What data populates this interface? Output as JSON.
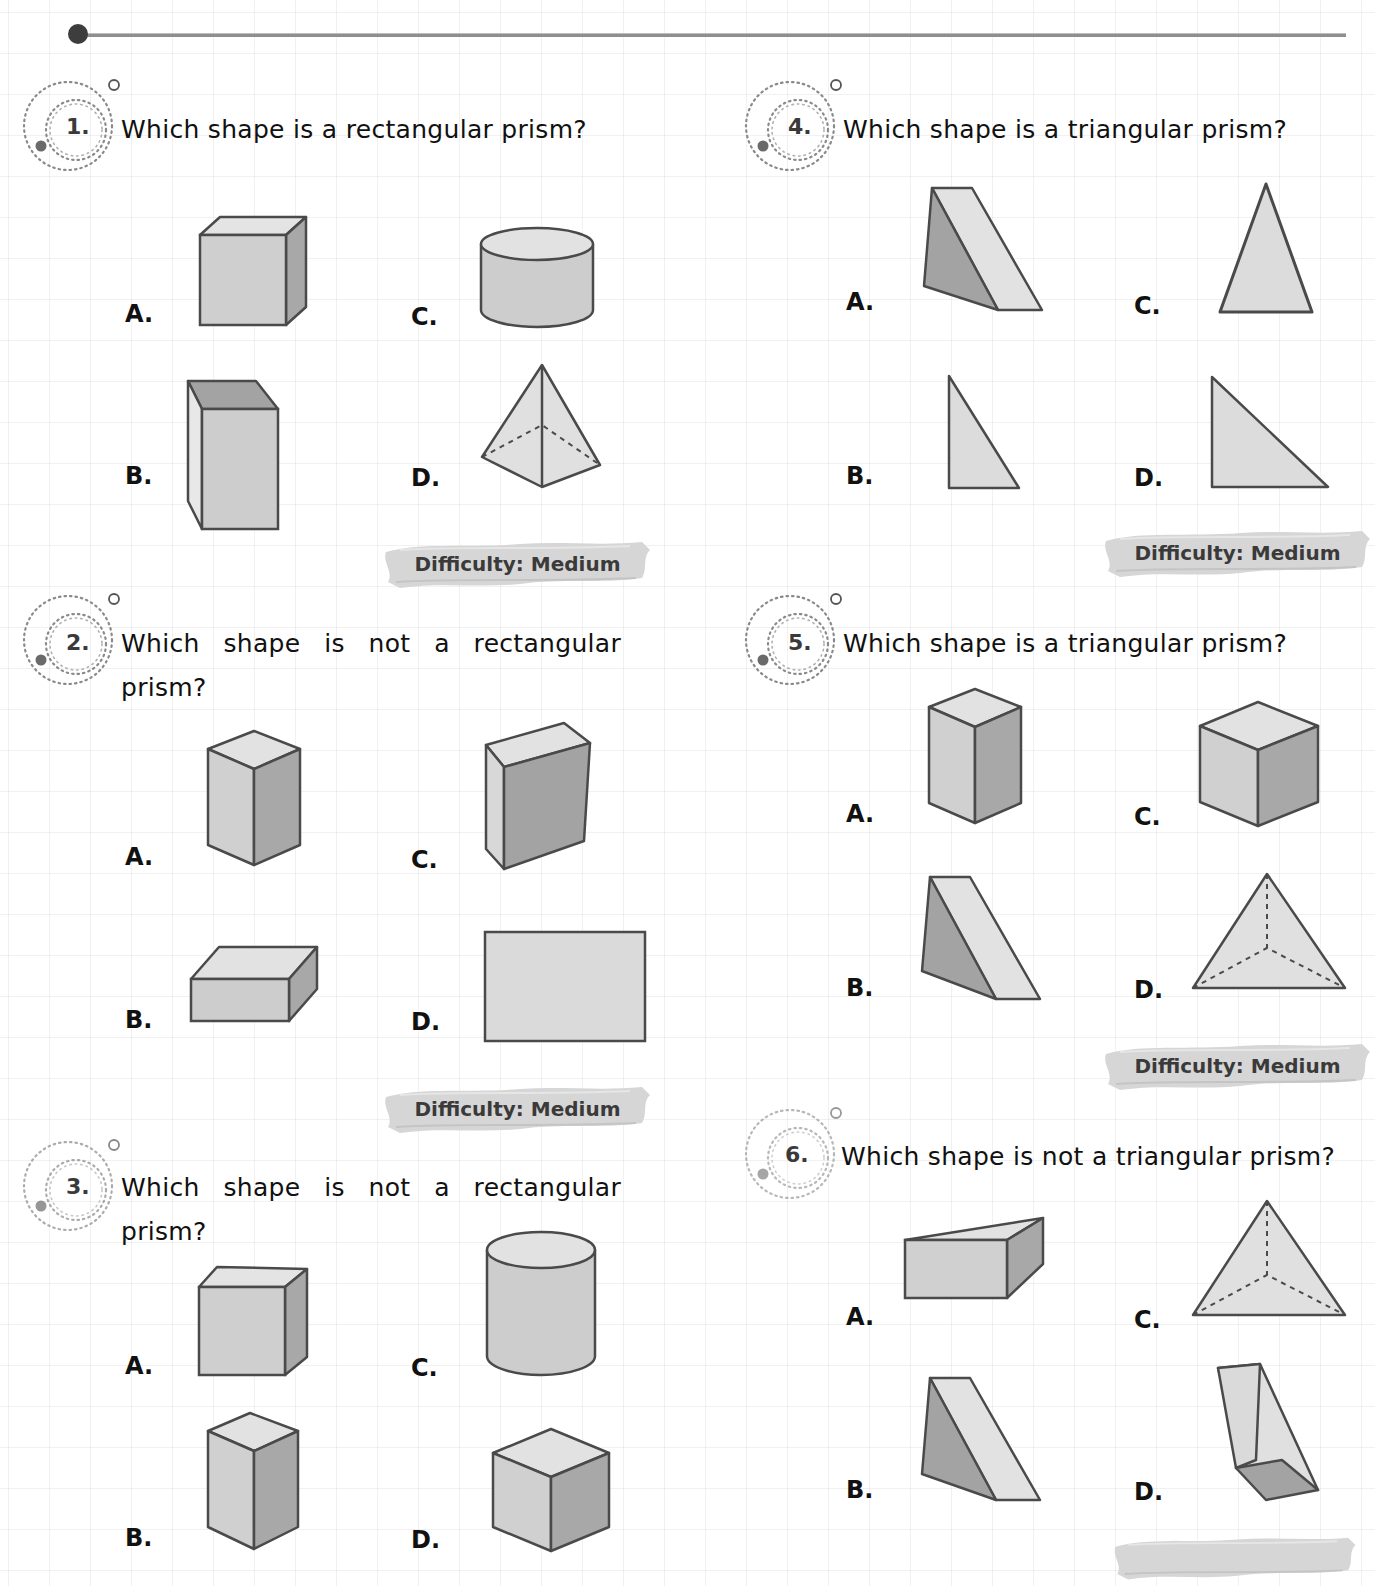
{
  "page": {
    "header_rule": "decorative horizontal rule",
    "colors": {
      "face_light": "#e4e4e4",
      "face_mid": "#cdcdcd",
      "face_dark": "#a3a3a3",
      "stroke": "#4a4a4a",
      "badge_brush": "#d6d6d6",
      "text": "#111111"
    }
  },
  "questions": [
    {
      "number": "1.",
      "text": "Which shape is a rectangular prism?",
      "options": [
        {
          "label": "A.",
          "shape": "cube"
        },
        {
          "label": "B.",
          "shape": "tall rectangular prism"
        },
        {
          "label": "C.",
          "shape": "cylinder"
        },
        {
          "label": "D.",
          "shape": "square pyramid"
        }
      ],
      "difficulty": "Difficulty: Medium"
    },
    {
      "number": "2.",
      "text": "Which shape is not a rectangular prism?",
      "options": [
        {
          "label": "A.",
          "shape": "tall rectangular prism"
        },
        {
          "label": "B.",
          "shape": "flat rectangular prism"
        },
        {
          "label": "C.",
          "shape": "slanted rectangular prism"
        },
        {
          "label": "D.",
          "shape": "rectangle"
        }
      ],
      "difficulty": "Difficulty: Medium"
    },
    {
      "number": "3.",
      "text": "Which shape is not a rectangular prism?",
      "options": [
        {
          "label": "A.",
          "shape": "cube"
        },
        {
          "label": "B.",
          "shape": "tall rectangular prism"
        },
        {
          "label": "C.",
          "shape": "cylinder"
        },
        {
          "label": "D.",
          "shape": "cube"
        }
      ],
      "difficulty": ""
    },
    {
      "number": "4.",
      "text": "Which shape is a triangular prism?",
      "options": [
        {
          "label": "A.",
          "shape": "triangular prism"
        },
        {
          "label": "B.",
          "shape": "right triangle"
        },
        {
          "label": "C.",
          "shape": "isosceles triangle"
        },
        {
          "label": "D.",
          "shape": "right triangle"
        }
      ],
      "difficulty": "Difficulty: Medium"
    },
    {
      "number": "5.",
      "text": "Which shape is a triangular prism?",
      "options": [
        {
          "label": "A.",
          "shape": "tall rectangular prism"
        },
        {
          "label": "B.",
          "shape": "triangular prism"
        },
        {
          "label": "C.",
          "shape": "cube"
        },
        {
          "label": "D.",
          "shape": "triangular pyramid"
        }
      ],
      "difficulty": "Difficulty: Medium"
    },
    {
      "number": "6.",
      "text": "Which shape is not a triangular prism?",
      "options": [
        {
          "label": "A.",
          "shape": "triangular prism lying flat"
        },
        {
          "label": "B.",
          "shape": "triangular prism"
        },
        {
          "label": "C.",
          "shape": "triangular pyramid"
        },
        {
          "label": "D.",
          "shape": "tilted triangular prism"
        }
      ],
      "difficulty": ""
    }
  ]
}
